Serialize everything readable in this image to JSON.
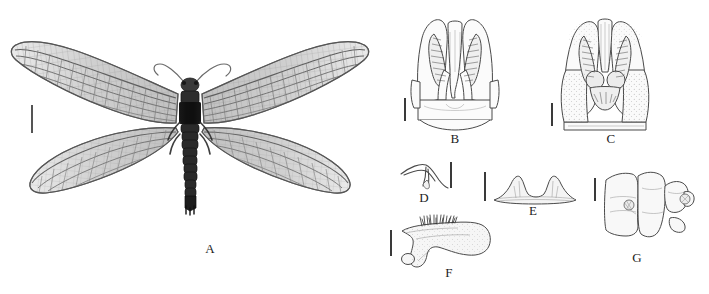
{
  "figure": {
    "type": "taxonomic-plate",
    "background_color": "#ffffff",
    "width": 709,
    "height": 294,
    "ink_color": "#2b2b2b",
    "scalebar_color": "#3a3a3a",
    "panel_count": 7
  },
  "panels": [
    {
      "id": "A",
      "label": "A",
      "kind": "specimen-photograph",
      "subject": "adult dobsonfly habitus, dorsal view, wings spread",
      "label_x": 200,
      "label_y": 244,
      "scalebar": {
        "x": 31,
        "y": 105,
        "height": 28
      }
    },
    {
      "id": "B",
      "label": "B",
      "kind": "line-drawing",
      "subject": "male genitalia, dorsal view",
      "label_x": 445,
      "label_y": 139,
      "scalebar": {
        "x": 404,
        "y": 98,
        "height": 23
      }
    },
    {
      "id": "C",
      "label": "C",
      "kind": "line-drawing",
      "subject": "male genitalia, ventral view",
      "label_x": 601,
      "label_y": 139,
      "scalebar": {
        "x": 551,
        "y": 103,
        "height": 23
      }
    },
    {
      "id": "D",
      "label": "D",
      "kind": "line-drawing",
      "subject": "gonostylus hook, lateral view",
      "label_x": 414,
      "label_y": 193,
      "scalebar": {
        "x": 450,
        "y": 162,
        "height": 26
      }
    },
    {
      "id": "E",
      "label": "E",
      "kind": "line-drawing",
      "subject": "bilobed sclerite, posterior view",
      "label_x": 523,
      "label_y": 206,
      "scalebar": {
        "x": 484,
        "y": 172,
        "height": 29
      }
    },
    {
      "id": "F",
      "label": "F",
      "kind": "line-drawing",
      "subject": "gonocoxite with setal brush, lateral view",
      "label_x": 439,
      "label_y": 267,
      "scalebar": {
        "x": 390,
        "y": 230,
        "height": 26
      }
    },
    {
      "id": "G",
      "label": "G",
      "kind": "line-drawing",
      "subject": "terminal abdominal segments, lateral view",
      "label_x": 627,
      "label_y": 252,
      "scalebar": {
        "x": 594,
        "y": 178,
        "height": 23
      }
    }
  ]
}
